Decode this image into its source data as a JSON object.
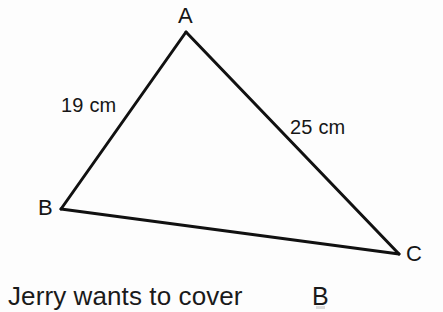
{
  "figure": {
    "type": "triangle-diagram",
    "background_color": "#fdfdfd",
    "stroke_color": "#111111",
    "stroke_width": 3,
    "vertices": [
      {
        "name": "A",
        "label": "A",
        "x": 186,
        "y": 32,
        "label_x": 178,
        "label_y": 5
      },
      {
        "name": "B",
        "label": "B",
        "x": 61,
        "y": 209,
        "label_x": 38,
        "label_y": 197
      },
      {
        "name": "C",
        "label": "C",
        "x": 399,
        "y": 254,
        "label_x": 406,
        "label_y": 243
      }
    ],
    "sides": [
      {
        "name": "AB",
        "from": "A",
        "to": "B",
        "label": "19 cm",
        "length_value": 19,
        "unit": "cm",
        "label_x": 61,
        "label_y": 95
      },
      {
        "name": "AC",
        "from": "A",
        "to": "C",
        "label": "25 cm",
        "length_value": 25,
        "unit": "cm",
        "label_x": 290,
        "label_y": 117
      },
      {
        "name": "BC",
        "from": "B",
        "to": "C",
        "label": "",
        "length_value": null,
        "unit": "",
        "label_x": 0,
        "label_y": 0
      }
    ]
  },
  "caption": {
    "text": "Jerry wants to cover",
    "trailing_label": "B"
  }
}
